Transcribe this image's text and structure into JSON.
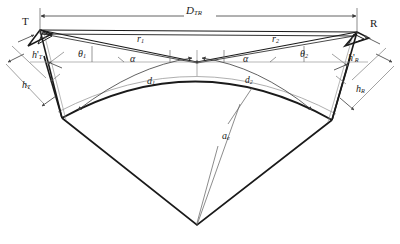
{
  "figure": {
    "kind": "geometry-diagram",
    "background": "#ffffff",
    "ink": "#1a1a1a",
    "thin_ink": "#6b6b6b",
    "width": 400,
    "height": 244
  },
  "labels": {
    "transmitter": {
      "text": "T",
      "italic": false,
      "x": 22,
      "y": 18,
      "size": 11
    },
    "receiver": {
      "text": "R",
      "italic": false,
      "x": 370,
      "y": 20,
      "size": 11
    },
    "baseline_distance": {
      "base": "D",
      "sub": "TR",
      "x": 186,
      "y": 6,
      "size": 11
    },
    "h_prime_T": {
      "base": "h",
      "prime": "'",
      "sub": "T",
      "x": 32,
      "y": 52,
      "size": 10
    },
    "h_T": {
      "base": "h",
      "sub": "T",
      "x": 22,
      "y": 82,
      "size": 10
    },
    "h_prime_R": {
      "base": "h",
      "prime": "'",
      "sub": "R",
      "x": 348,
      "y": 55,
      "size": 10
    },
    "h_R": {
      "base": "h",
      "sub": "R",
      "x": 356,
      "y": 86,
      "size": 10
    },
    "theta_1": {
      "base": "θ",
      "sub": "1",
      "x": 78,
      "y": 51,
      "size": 10
    },
    "theta_2": {
      "base": "θ",
      "sub": "2",
      "x": 300,
      "y": 51,
      "size": 10
    },
    "alpha_left": {
      "base": "α",
      "sub": "",
      "x": 130,
      "y": 56,
      "size": 10
    },
    "alpha_right": {
      "base": "α",
      "sub": "",
      "x": 243,
      "y": 56,
      "size": 10
    },
    "r_1": {
      "base": "r",
      "sub": "1",
      "x": 137,
      "y": 36,
      "size": 10
    },
    "r_2": {
      "base": "r",
      "sub": "2",
      "x": 272,
      "y": 36,
      "size": 10
    },
    "d_1": {
      "base": "d",
      "sub": "1",
      "x": 147,
      "y": 78,
      "size": 10
    },
    "d_2": {
      "base": "d",
      "sub": "2",
      "x": 245,
      "y": 78,
      "size": 10
    },
    "a_e": {
      "base": "a",
      "sub": "e",
      "x": 222,
      "y": 133,
      "size": 10
    }
  },
  "geometry": {
    "point_T": {
      "x": 40,
      "y": 30
    },
    "point_R": {
      "x": 357,
      "y": 32
    },
    "reflection_point": {
      "x": 197,
      "y": 62
    },
    "earth_center": {
      "x": 197,
      "y": 225
    },
    "horizontal_axis_y": 62,
    "earth_arc_peak": {
      "x": 197,
      "y": 60
    },
    "left_arc_end": {
      "x": 62,
      "y": 118
    },
    "right_arc_end": {
      "x": 332,
      "y": 120
    }
  },
  "annotations": {
    "dimension_arrows": "double-headed",
    "arc_symbol": "curved arc with arrowheads"
  }
}
